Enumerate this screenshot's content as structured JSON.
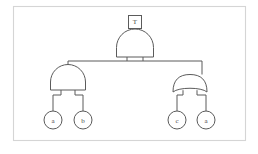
{
  "diagram": {
    "kind": "fault-tree",
    "frame": {
      "stroke_color": "#d5d5d5",
      "fill_color": "#ffffff"
    },
    "line_color": "#5b5b5b",
    "top_event": {
      "id": "T",
      "label": "T",
      "shape": "rectangle"
    },
    "gates": [
      {
        "id": "gate-top",
        "type": "AND",
        "label": "",
        "parent": "T",
        "children": [
          "gate-left",
          "gate-right"
        ]
      },
      {
        "id": "gate-left",
        "type": "AND",
        "label": "",
        "parent": "gate-top",
        "children": [
          "event-a-left",
          "event-b"
        ]
      },
      {
        "id": "gate-right",
        "type": "OR",
        "label": "",
        "parent": "gate-top",
        "children": [
          "event-c",
          "event-a-right"
        ]
      }
    ],
    "basic_events": [
      {
        "id": "event-a-left",
        "label": "a",
        "parent": "gate-left"
      },
      {
        "id": "event-b",
        "label": "b",
        "parent": "gate-left"
      },
      {
        "id": "event-c",
        "label": "c",
        "parent": "gate-right"
      },
      {
        "id": "event-a-right",
        "label": "a",
        "parent": "gate-right"
      }
    ]
  }
}
